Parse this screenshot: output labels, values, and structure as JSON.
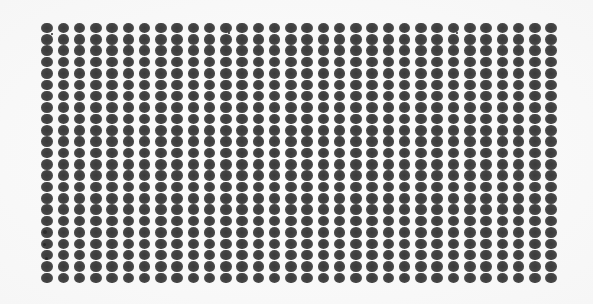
{
  "image": {
    "description": "Scanned array of dark grey dots on white background",
    "grid": {
      "columns": 32,
      "rows": 23,
      "origin_x": 47,
      "origin_y": 28,
      "spacing_x": 16.26,
      "spacing_y": 11.36,
      "dot_width": 11.5,
      "dot_height": 10.6
    },
    "colors": {
      "background": "#fbfbfb",
      "dot": "#444444"
    },
    "artifacts": [
      {
        "x": 45,
        "y": 232,
        "r": 2
      },
      {
        "x": 44,
        "y": 244,
        "r": 1.5
      },
      {
        "x": 46,
        "y": 258,
        "r": 1.5
      },
      {
        "x": 52,
        "y": 34,
        "r": 1.2
      },
      {
        "x": 229,
        "y": 33,
        "r": 1
      },
      {
        "x": 457,
        "y": 33,
        "r": 1
      }
    ]
  }
}
